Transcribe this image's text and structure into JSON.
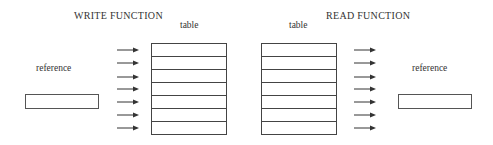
{
  "write": {
    "title": "WRITE FUNCTION",
    "table_label": "table",
    "reference_label": "reference",
    "rows": 7
  },
  "read": {
    "title": "READ FUNCTION",
    "table_label": "table",
    "reference_label": "reference",
    "rows": 7
  },
  "icons": {
    "arrow": "arrow-right-icon"
  }
}
